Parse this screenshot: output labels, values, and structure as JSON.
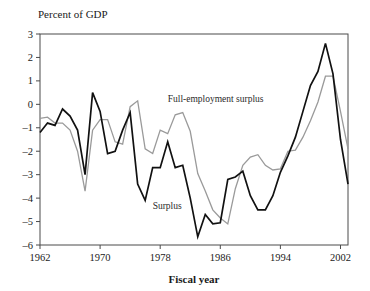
{
  "chart_data": {
    "type": "line",
    "title": "Percent of GDP",
    "xlabel": "Fiscal year",
    "ylabel": "Percent of GDP",
    "grid": false,
    "legend_position": "inline-annotation",
    "xlim": [
      1962,
      2003
    ],
    "ylim": [
      -6,
      3
    ],
    "x_ticks": [
      "1962",
      "1970",
      "1978",
      "1986",
      "1994",
      "2002"
    ],
    "x_tick_values": [
      1962,
      1970,
      1978,
      1986,
      1994,
      2002
    ],
    "y_ticks": [
      "3",
      "2",
      "1",
      "0",
      "-1",
      "-2",
      "-3",
      "-4",
      "-5",
      "-6"
    ],
    "y_tick_values": [
      3,
      2,
      1,
      0,
      -1,
      -2,
      -3,
      -4,
      -5,
      -6
    ],
    "x": [
      1962,
      1963,
      1964,
      1965,
      1966,
      1967,
      1968,
      1969,
      1970,
      1971,
      1972,
      1973,
      1974,
      1975,
      1976,
      1977,
      1978,
      1979,
      1980,
      1981,
      1982,
      1983,
      1984,
      1985,
      1986,
      1987,
      1988,
      1989,
      1990,
      1991,
      1992,
      1993,
      1994,
      1995,
      1996,
      1997,
      1998,
      1999,
      2000,
      2001,
      2002,
      2003
    ],
    "series": [
      {
        "name": "Surplus",
        "color": "#111111",
        "width": 1.7,
        "label_x": 1977,
        "label_y": -4.45,
        "values": [
          -1.2,
          -0.8,
          -0.9,
          -0.2,
          -0.5,
          -1.1,
          -3.0,
          0.5,
          -0.3,
          -2.1,
          -2.0,
          -1.1,
          -0.35,
          -3.4,
          -4.1,
          -2.7,
          -2.7,
          -1.6,
          -2.7,
          -2.6,
          -4.0,
          -5.65,
          -4.7,
          -5.1,
          -5.05,
          -3.2,
          -3.1,
          -2.85,
          -3.9,
          -4.5,
          -4.5,
          -3.9,
          -2.9,
          -2.2,
          -1.4,
          -0.3,
          0.8,
          1.4,
          2.6,
          1.3,
          -1.5,
          -3.4
        ]
      },
      {
        "name": "Full-employment surplus",
        "color": "#9a9a9a",
        "width": 1.3,
        "label_x": 1979,
        "label_y": 0.1,
        "values": [
          -0.6,
          -0.55,
          -0.8,
          -0.8,
          -1.1,
          -2.0,
          -3.7,
          -1.1,
          -0.65,
          -0.65,
          -1.6,
          -1.7,
          -0.1,
          0.15,
          -1.9,
          -2.1,
          -1.1,
          -1.25,
          -0.45,
          -0.35,
          -1.15,
          -2.95,
          -3.7,
          -4.5,
          -4.85,
          -5.1,
          -3.6,
          -2.6,
          -2.25,
          -2.15,
          -2.6,
          -2.8,
          -2.75,
          -2.0,
          -1.95,
          -1.4,
          -0.7,
          0.1,
          1.2,
          1.2,
          -0.3,
          -1.9
        ]
      }
    ]
  },
  "annotations": {
    "y_axis_title": "Percent of GDP",
    "x_axis_title": "Fiscal year",
    "series_one_label": "Surplus",
    "series_two_label": "Full-employment surplus"
  }
}
